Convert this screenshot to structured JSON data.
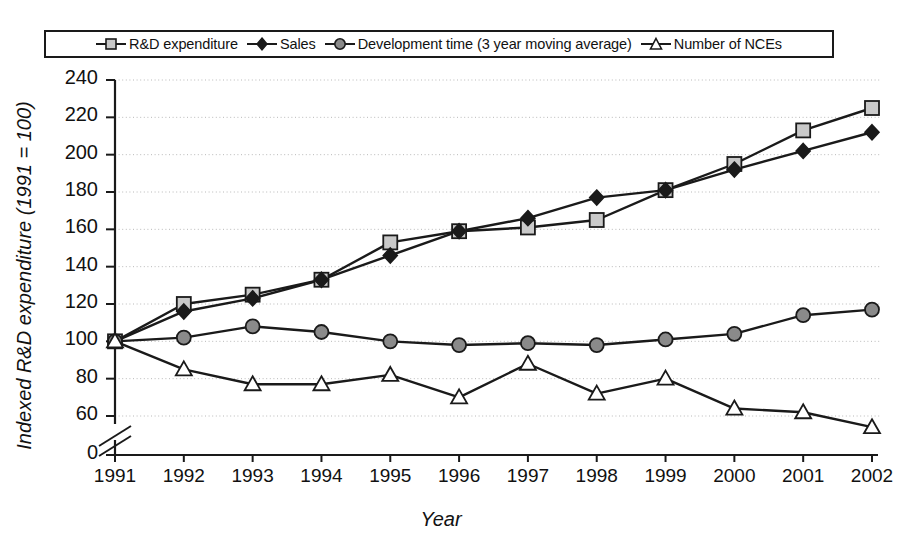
{
  "figure": {
    "background": "#ffffff",
    "ink_color": "#1a1a1a"
  },
  "legend": {
    "position": "top",
    "entries": [
      {
        "label": "R&D expenditure",
        "marker": "square-marker",
        "fill": "#c9c9c9",
        "stroke": "#1a1a1a"
      },
      {
        "label": "Sales",
        "marker": "diamond-marker",
        "fill": "#1a1a1a",
        "stroke": "#1a1a1a"
      },
      {
        "label": "Development time (3 year moving average)",
        "marker": "circle-marker",
        "fill": "#8a8a8a",
        "stroke": "#1a1a1a"
      },
      {
        "label": "Number of NCEs",
        "marker": "triangle-marker",
        "fill": "#ffffff",
        "stroke": "#1a1a1a"
      }
    ]
  },
  "axes": {
    "y_title": "Indexed R&D expenditure (1991 = 100)",
    "x_title": "Year",
    "y_ticks": [
      "240",
      "220",
      "200",
      "180",
      "160",
      "140",
      "120",
      "100",
      "80",
      "60",
      "0"
    ],
    "x_ticks": [
      "1991",
      "1992",
      "1993",
      "1994",
      "1995",
      "1996",
      "1997",
      "1998",
      "1999",
      "2000",
      "2001",
      "2002"
    ],
    "y_axis_break": true,
    "grid": "horizontal-dotted"
  },
  "chart_data": {
    "type": "line",
    "title": "",
    "subtitle": "",
    "xlabel": "Year",
    "ylabel": "Indexed R&D expenditure (1991 = 100)",
    "categories": [
      "1991",
      "1992",
      "1993",
      "1994",
      "1995",
      "1996",
      "1997",
      "1998",
      "1999",
      "2000",
      "2001",
      "2002"
    ],
    "x": [
      1991,
      1992,
      1993,
      1994,
      1995,
      1996,
      1997,
      1998,
      1999,
      2000,
      2001,
      2002
    ],
    "ylim": [
      60,
      240
    ],
    "y_break_below": 60,
    "y_tick_values": [
      240,
      220,
      200,
      180,
      160,
      140,
      120,
      100,
      80,
      60,
      0
    ],
    "grid": true,
    "legend_position": "top",
    "series": [
      {
        "name": "R&D expenditure",
        "marker": "square",
        "color": "#1a1a1a",
        "marker_fill": "#c9c9c9",
        "values": [
          100,
          120,
          125,
          133,
          153,
          159,
          161,
          165,
          181,
          195,
          213,
          225
        ]
      },
      {
        "name": "Sales",
        "marker": "diamond",
        "color": "#1a1a1a",
        "marker_fill": "#1a1a1a",
        "values": [
          100,
          116,
          123,
          133,
          146,
          159,
          166,
          177,
          181,
          192,
          202,
          212
        ]
      },
      {
        "name": "Development time (3 year moving average)",
        "marker": "circle",
        "color": "#1a1a1a",
        "marker_fill": "#8a8a8a",
        "values": [
          100,
          102,
          108,
          105,
          100,
          98,
          99,
          98,
          101,
          104,
          114,
          117
        ]
      },
      {
        "name": "Number of NCEs",
        "marker": "triangle",
        "color": "#1a1a1a",
        "marker_fill": "#ffffff",
        "values": [
          100,
          85,
          77,
          77,
          82,
          70,
          88,
          72,
          80,
          64,
          62,
          54
        ]
      }
    ]
  }
}
